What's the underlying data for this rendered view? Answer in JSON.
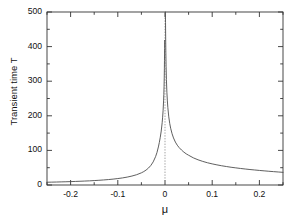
{
  "chart_data": {
    "type": "line",
    "title": "",
    "xlabel": "μ",
    "ylabel": "Transient time T",
    "xlim": [
      -0.25,
      0.25
    ],
    "ylim": [
      0,
      500
    ],
    "grid": false,
    "legend": null,
    "x_ticks_major": [
      -0.2,
      -0.1,
      0,
      0.1,
      0.2
    ],
    "x_tick_labels": [
      "-0.2",
      "-0.1",
      "0",
      "0.1",
      "0.2"
    ],
    "x_ticks_minor": [
      -0.25,
      -0.15,
      -0.05,
      0.05,
      0.15,
      0.25
    ],
    "y_ticks_major": [
      0,
      100,
      200,
      300,
      400,
      500
    ],
    "y_tick_labels": [
      "0",
      "100",
      "200",
      "300",
      "400",
      "500"
    ],
    "y_ticks_minor": [
      50,
      150,
      250,
      350,
      450
    ],
    "annotations": [
      {
        "name": "asymptote",
        "type": "vertical-dashed-line",
        "x": 0,
        "style": "dotted",
        "color": "#999999"
      }
    ],
    "series": [
      {
        "name": "transient-time-left-branch",
        "color": "#4d4d4d",
        "linewidth": 0.9,
        "x": [
          -0.25,
          -0.24,
          -0.23,
          -0.22,
          -0.21,
          -0.2,
          -0.19,
          -0.18,
          -0.17,
          -0.16,
          -0.15,
          -0.14,
          -0.13,
          -0.12,
          -0.11,
          -0.1,
          -0.09,
          -0.08,
          -0.07,
          -0.06,
          -0.05,
          -0.045,
          -0.04,
          -0.035,
          -0.03,
          -0.025,
          -0.02,
          -0.017,
          -0.014,
          -0.012,
          -0.01,
          -0.008,
          -0.006,
          -0.005,
          -0.004,
          -0.003,
          -0.0025,
          -0.002,
          -0.0016,
          -0.0013,
          -0.0011,
          -0.001,
          -0.0009,
          -0.0008
        ],
        "y": [
          8,
          8.3,
          8.6,
          9,
          9.4,
          9.8,
          10.3,
          10.8,
          11.4,
          12,
          12.8,
          13.6,
          14.6,
          15.7,
          17,
          18.6,
          20.5,
          22.9,
          25.9,
          29.8,
          35.2,
          38.8,
          43.3,
          49,
          56.5,
          66.8,
          81.8,
          93.9,
          110,
          123,
          138,
          156,
          180,
          196,
          216,
          243,
          261,
          284,
          310,
          337,
          360,
          376,
          395,
          418
        ],
        "notes": "Diverges toward T = 500 as μ approaches 0 from the left"
      },
      {
        "name": "transient-time-right-branch",
        "color": "#4d4d4d",
        "linewidth": 0.9,
        "x": [
          0.0009,
          0.0011,
          0.0014,
          0.0018,
          0.0023,
          0.003,
          0.004,
          0.005,
          0.006,
          0.008,
          0.01,
          0.012,
          0.015,
          0.018,
          0.022,
          0.026,
          0.03,
          0.035,
          0.04,
          0.045,
          0.05,
          0.06,
          0.07,
          0.08,
          0.09,
          0.1,
          0.11,
          0.12,
          0.13,
          0.14,
          0.15,
          0.16,
          0.17,
          0.18,
          0.19,
          0.2,
          0.21,
          0.22,
          0.23,
          0.24,
          0.25
        ],
        "y": [
          500,
          470,
          425,
          382,
          343,
          305,
          268,
          243,
          224,
          197,
          178,
          164,
          148,
          136,
          124,
          115,
          108,
          101,
          95,
          90,
          86,
          78.5,
          72.8,
          68.2,
          64.3,
          61,
          58.2,
          55.6,
          53.4,
          51.3,
          49.5,
          47.8,
          46.2,
          44.7,
          43.4,
          42.1,
          40.9,
          39.7,
          38.6,
          37.6,
          36.6
        ],
        "notes": "Diverges toward T = 500 as μ approaches 0 from the right; decays slowly for larger μ"
      }
    ]
  },
  "figure": {
    "background_color": "#ffffff",
    "axis_color": "#333333",
    "curve_color": "#4d4d4d",
    "dashed_line_color": "#999999",
    "tick_label_color": "#111111"
  }
}
